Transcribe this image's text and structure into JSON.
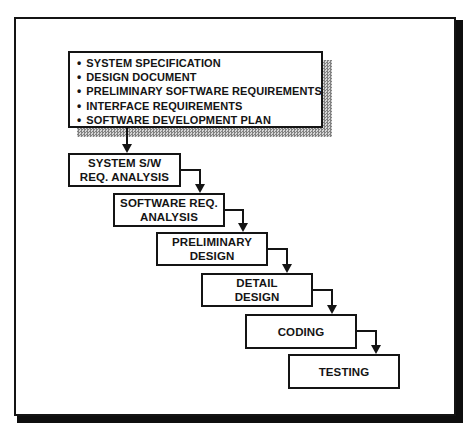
{
  "diagram": {
    "type": "waterfall-process-flow",
    "bullet_glyph": "•",
    "colors": {
      "ink": "#141414",
      "paper": "#ffffff",
      "frame_shadow": "#0e0e0e",
      "doc_box_shadow_gray": "#828282"
    },
    "documents_box": {
      "items": [
        "SYSTEM SPECIFICATION",
        "DESIGN DOCUMENT",
        "PRELIMINARY SOFTWARE REQUIREMENTS",
        "INTERFACE REQUIREMENTS",
        "SOFTWARE DEVELOPMENT PLAN"
      ]
    },
    "stages": [
      {
        "id": "system-sw-req-analysis",
        "lines": [
          "SYSTEM S/W",
          "REQ. ANALYSIS"
        ]
      },
      {
        "id": "software-req-analysis",
        "lines": [
          "SOFTWARE REQ.",
          "ANALYSIS"
        ]
      },
      {
        "id": "preliminary-design",
        "lines": [
          "PRELIMINARY",
          "DESIGN"
        ]
      },
      {
        "id": "detail-design",
        "lines": [
          "DETAIL",
          "DESIGN"
        ]
      },
      {
        "id": "coding",
        "lines": [
          "CODING"
        ]
      },
      {
        "id": "testing",
        "lines": [
          "TESTING"
        ]
      }
    ]
  }
}
